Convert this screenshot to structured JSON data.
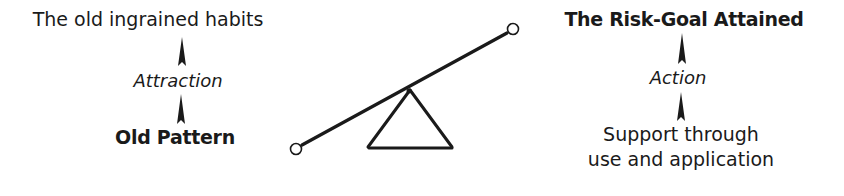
{
  "left_column": {
    "top_label": "The old ingrained habits",
    "middle_label": "Attraction",
    "bottom_label": "Old Pattern"
  },
  "right_column": {
    "top_label": "The Risk-Goal Attained",
    "middle_label": "Action",
    "bottom_label_line1": "Support through",
    "bottom_label_line2": "use and application"
  },
  "seesaw": {
    "description": "Lever balanced on a triangular fulcrum, tilted up to the right",
    "color": "#1a1a1a"
  }
}
